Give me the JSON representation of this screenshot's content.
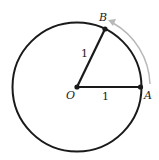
{
  "diagram": {
    "type": "unit-circle-arc",
    "points": {
      "O": {
        "label": "O"
      },
      "A": {
        "label": "A"
      },
      "B": {
        "label": "B"
      }
    },
    "segments": {
      "OA": {
        "length_label": "1"
      },
      "OB": {
        "length_label": "1"
      }
    },
    "arrow": {
      "description": "counterclockwise arc from A to B",
      "color": "#b8b8b8"
    },
    "colors": {
      "stroke": "#1a1a1a",
      "arrow": "#b8b8b8",
      "background": "#ffffff"
    }
  }
}
